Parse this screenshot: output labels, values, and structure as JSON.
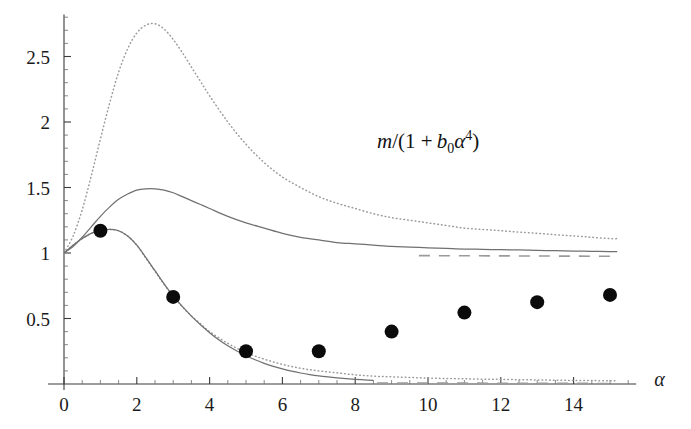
{
  "figure": {
    "background": "#ffffff",
    "annotation": {
      "m": "m",
      "open": "/(1 +",
      "b": "b",
      "bsub": "0",
      "alpha": "α",
      "asup": "4",
      "close": ")",
      "full_text": "m/(1 + b₀α⁴)"
    },
    "xaxis_name": "α"
  },
  "chart_data": {
    "type": "line",
    "title": "",
    "xlabel": "α",
    "ylabel": "",
    "annotations": [
      {
        "text": "m/(1 + b₀α⁴)",
        "x": 8.6,
        "y": 1.8
      }
    ],
    "xlim": [
      0,
      15.5
    ],
    "ylim": [
      0,
      2.82
    ],
    "xticks": [
      0,
      2,
      4,
      6,
      8,
      10,
      12,
      14
    ],
    "xtick_labels": [
      "0",
      "2",
      "4",
      "6",
      "8",
      "10",
      "12",
      "14"
    ],
    "xtick_minor_step": 0.5,
    "yticks": [
      0.5,
      1,
      1.5,
      2,
      2.5
    ],
    "ytick_labels": [
      "0.5",
      "1",
      "1.5",
      "2",
      "2.5"
    ],
    "ytick_minor_step": 0.1,
    "grid": false,
    "legend": "none",
    "series": [
      {
        "name": "upper-dotted",
        "style": "dotted",
        "color": "#9a9a9a",
        "x": [
          0,
          0.25,
          0.5,
          0.75,
          1,
          1.25,
          1.5,
          1.75,
          2,
          2.25,
          2.5,
          2.75,
          3,
          3.25,
          3.5,
          3.75,
          4,
          4.5,
          5,
          5.5,
          6,
          6.5,
          7,
          7.5,
          8,
          8.5,
          9,
          9.5,
          10,
          10.5,
          11,
          11.5,
          12,
          12.5,
          13,
          13.5,
          14,
          14.5,
          15,
          15.2
        ],
        "y": [
          1.0,
          1.13,
          1.33,
          1.59,
          1.87,
          2.14,
          2.38,
          2.56,
          2.68,
          2.74,
          2.75,
          2.71,
          2.63,
          2.53,
          2.42,
          2.31,
          2.2,
          2.0,
          1.83,
          1.69,
          1.58,
          1.5,
          1.43,
          1.38,
          1.34,
          1.3,
          1.27,
          1.25,
          1.23,
          1.21,
          1.19,
          1.18,
          1.17,
          1.16,
          1.15,
          1.14,
          1.13,
          1.12,
          1.11,
          1.11
        ]
      },
      {
        "name": "middle-solid",
        "style": "solid",
        "color": "#707070",
        "x": [
          0,
          0.25,
          0.5,
          0.75,
          1,
          1.25,
          1.5,
          1.75,
          2,
          2.25,
          2.5,
          2.75,
          3,
          3.25,
          3.5,
          3.75,
          4,
          4.5,
          5,
          5.5,
          6,
          6.5,
          7,
          7.5,
          8,
          8.5,
          9,
          9.5,
          10,
          10.5,
          11,
          11.5,
          12,
          12.5,
          13,
          13.5,
          14,
          14.5,
          15,
          15.2
        ],
        "y": [
          1.0,
          1.05,
          1.12,
          1.2,
          1.28,
          1.35,
          1.41,
          1.45,
          1.48,
          1.49,
          1.49,
          1.48,
          1.46,
          1.43,
          1.4,
          1.37,
          1.34,
          1.28,
          1.23,
          1.19,
          1.15,
          1.12,
          1.1,
          1.08,
          1.07,
          1.06,
          1.05,
          1.045,
          1.04,
          1.035,
          1.03,
          1.028,
          1.025,
          1.023,
          1.02,
          1.018,
          1.015,
          1.013,
          1.01,
          1.01
        ]
      },
      {
        "name": "lower-dotted",
        "style": "dotted",
        "color": "#9a9a9a",
        "x": [
          0,
          0.25,
          0.5,
          0.75,
          1,
          1.25,
          1.5,
          1.75,
          2,
          2.25,
          2.5,
          2.75,
          3,
          3.25,
          3.5,
          3.75,
          4,
          4.5,
          5,
          5.5,
          6,
          6.5,
          7,
          7.5,
          8,
          8.5,
          9,
          9.5,
          10,
          10.5,
          11,
          11.5,
          12,
          12.5,
          13,
          13.5,
          14,
          14.5,
          15,
          15.2
        ],
        "y": [
          1.0,
          1.06,
          1.11,
          1.15,
          1.17,
          1.18,
          1.17,
          1.13,
          1.06,
          0.96,
          0.86,
          0.76,
          0.67,
          0.59,
          0.52,
          0.46,
          0.4,
          0.31,
          0.24,
          0.19,
          0.15,
          0.12,
          0.1,
          0.085,
          0.07,
          0.06,
          0.055,
          0.05,
          0.045,
          0.042,
          0.04,
          0.037,
          0.035,
          0.033,
          0.031,
          0.029,
          0.027,
          0.026,
          0.025,
          0.024
        ]
      },
      {
        "name": "lower-solid",
        "style": "solid",
        "color": "#707070",
        "x": [
          0,
          0.25,
          0.5,
          0.75,
          1,
          1.25,
          1.5,
          1.75,
          2,
          2.25,
          2.5,
          2.75,
          3,
          3.25,
          3.5,
          3.75,
          4,
          4.25,
          4.5,
          4.75,
          5,
          5.25,
          5.5,
          5.75,
          6,
          6.25,
          6.5,
          6.75,
          7,
          7.25,
          7.5,
          7.75,
          8,
          8.25,
          8.5
        ],
        "y": [
          1.0,
          1.06,
          1.11,
          1.15,
          1.17,
          1.18,
          1.17,
          1.13,
          1.06,
          0.965,
          0.865,
          0.765,
          0.672,
          0.592,
          0.518,
          0.452,
          0.392,
          0.338,
          0.292,
          0.252,
          0.216,
          0.185,
          0.158,
          0.135,
          0.115,
          0.098,
          0.084,
          0.072,
          0.062,
          0.054,
          0.047,
          0.041,
          0.036,
          0.032,
          0.028
        ]
      },
      {
        "name": "asymptote-dashed",
        "style": "dashed",
        "color": "#9a9a9a",
        "x": [
          9.75,
          15.2
        ],
        "y": [
          0.98,
          0.975
        ]
      },
      {
        "name": "baseline-dashed",
        "style": "dashed",
        "color": "#9a9a9a",
        "x": [
          8.6,
          15.2
        ],
        "y": [
          0.008,
          0.004
        ]
      }
    ],
    "scatter": {
      "name": "data-points",
      "marker": "filled-circle",
      "color": "#0b0b0b",
      "size": 7,
      "x": [
        1,
        3,
        5,
        7,
        9,
        11,
        13,
        15
      ],
      "y": [
        1.17,
        0.665,
        0.25,
        0.25,
        0.4,
        0.545,
        0.625,
        0.68
      ]
    }
  }
}
